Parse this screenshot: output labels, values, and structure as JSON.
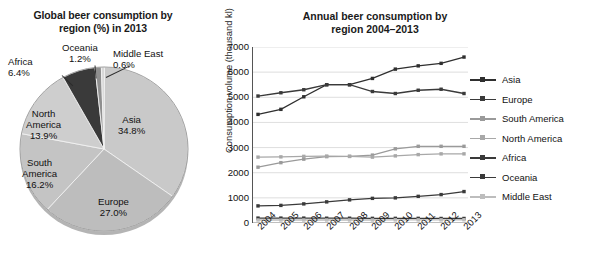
{
  "pie": {
    "title": "Global beer consumption by region (%) in 2013",
    "title_line1": "Global beer consumption by",
    "title_line2": "region (%) in 2013",
    "labels": {
      "africa_name": "Africa",
      "africa_value": "6.4%",
      "oceania_name": "Oceania",
      "oceania_value": "1.2%",
      "middle_east_name": "Middle East",
      "middle_east_value": "0.6%",
      "north_america_name": "North",
      "north_america_name2": "America",
      "north_america_value": "13.9%",
      "asia_name": "Asia",
      "asia_value": "34.8%",
      "south_america_name": "South",
      "south_america_name2": "America",
      "south_america_value": "16.2%",
      "europe_name": "Europe",
      "europe_value": "27.0%"
    }
  },
  "line": {
    "title_line1": "Annual beer consumption by",
    "title_line2": "region 2004–2013"
  },
  "legend": {
    "items": [
      {
        "label": "Asia",
        "color": "#2f2f2f"
      },
      {
        "label": "Europe",
        "color": "#3a3a3a"
      },
      {
        "label": "South America",
        "color": "#9a9a9a"
      },
      {
        "label": "North America",
        "color": "#a8a8a8"
      },
      {
        "label": "Africa",
        "color": "#3a3a3a"
      },
      {
        "label": "Oceania",
        "color": "#3a3a3a"
      },
      {
        "label": "Middle East",
        "color": "#bdbdbd"
      }
    ]
  },
  "chart_data": [
    {
      "type": "pie",
      "title": "Global beer consumption by region (%) in 2013",
      "unit": "%",
      "legend_position": "labels-on-slices",
      "slices": [
        {
          "name": "Asia",
          "value": 34.8,
          "color": "#c9c9c9"
        },
        {
          "name": "Europe",
          "value": 27.0,
          "color": "#bdbdbd"
        },
        {
          "name": "South America",
          "value": 16.2,
          "color": "#c4c4c4"
        },
        {
          "name": "North America",
          "value": 13.9,
          "color": "#cecece"
        },
        {
          "name": "Africa",
          "value": 6.4,
          "color": "#3a3a3a"
        },
        {
          "name": "Oceania",
          "value": 1.2,
          "color": "#8f8f8f"
        },
        {
          "name": "Middle East",
          "value": 0.6,
          "color": "#d8d8d8"
        }
      ]
    },
    {
      "type": "line",
      "title": "Annual beer consumption by region 2004–2013",
      "xlabel": "",
      "ylabel": "Consumption volume (thousand kl)",
      "x": [
        "2004",
        "2005",
        "2006",
        "2007",
        "2008",
        "2009",
        "2010",
        "2011",
        "2012",
        "2013"
      ],
      "ylim": [
        0,
        7000
      ],
      "yticks": [
        0,
        1000,
        2000,
        3000,
        4000,
        5000,
        6000,
        7000
      ],
      "grid": true,
      "legend_position": "right",
      "series": [
        {
          "name": "Asia",
          "color": "#2f2f2f",
          "values": [
            4320,
            4520,
            5020,
            5500,
            5500,
            5750,
            6120,
            6250,
            6350,
            6600
          ]
        },
        {
          "name": "Europe",
          "color": "#3a3a3a",
          "values": [
            5050,
            5180,
            5300,
            5500,
            5500,
            5230,
            5150,
            5280,
            5320,
            5150
          ]
        },
        {
          "name": "South America",
          "color": "#9a9a9a",
          "values": [
            2220,
            2400,
            2540,
            2640,
            2650,
            2700,
            2950,
            3050,
            3050,
            3050
          ]
        },
        {
          "name": "North America",
          "color": "#a8a8a8",
          "values": [
            2620,
            2630,
            2650,
            2660,
            2650,
            2620,
            2670,
            2720,
            2750,
            2750
          ]
        },
        {
          "name": "Africa",
          "color": "#3a3a3a",
          "values": [
            680,
            700,
            760,
            840,
            920,
            980,
            1000,
            1060,
            1130,
            1250
          ]
        },
        {
          "name": "Oceania",
          "color": "#3a3a3a",
          "values": [
            195,
            195,
            195,
            190,
            190,
            185,
            185,
            185,
            180,
            180
          ]
        },
        {
          "name": "Middle East",
          "color": "#bdbdbd",
          "values": [
            120,
            120,
            120,
            120,
            120,
            120,
            125,
            125,
            125,
            130
          ]
        }
      ]
    }
  ]
}
